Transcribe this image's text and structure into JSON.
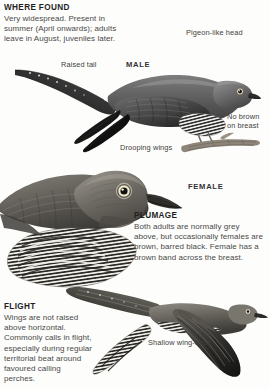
{
  "page": {
    "background": "#fdfdfb",
    "text_color": "#3d3d3d",
    "heading_color": "#1f1f1f"
  },
  "sections": [
    {
      "id": "where-found",
      "heading": "WHERE FOUND",
      "body": "Very widespread. Present in summer (April onwards); adults leave in August, juveniles later."
    },
    {
      "id": "plumage",
      "heading": "PLUMAGE",
      "body": "Both adults are normally grey above, but occasionally females are brown, barred black. Female has a brown band across the breast."
    },
    {
      "id": "flight",
      "heading": "FLIGHT",
      "body": "Wings are not raised above horizontal. Commonly calls in flight, especially during regular territorial beat around favoured calling perches."
    }
  ],
  "sex_labels": {
    "male": "MALE",
    "female": "FEMALE"
  },
  "callouts": {
    "pigeon_head": "Pigeon-like head",
    "raised_tail": "Raised tail",
    "no_brown_line1": "No brown",
    "no_brown_line2": "on breast",
    "drooping_wings": "Drooping wings",
    "shallow_wingbeat": "Shallow wing-beat"
  },
  "illustrations": [
    {
      "id": "male-perched",
      "name": "male-cuckoo-perched-illustration",
      "subject": "Cuckoo, adult male, perched on branch with raised tail and drooping wings",
      "style": "greyscale-painting"
    },
    {
      "id": "female-portrait",
      "name": "female-cuckoo-portrait-illustration",
      "subject": "Cuckoo, adult female, head and breast portrait showing barred underparts",
      "style": "greyscale-painting"
    },
    {
      "id": "flight",
      "name": "cuckoo-in-flight-illustration",
      "subject": "Cuckoo in flight, side profile with pointed wings held at or below horizontal",
      "style": "greyscale-painting"
    }
  ]
}
